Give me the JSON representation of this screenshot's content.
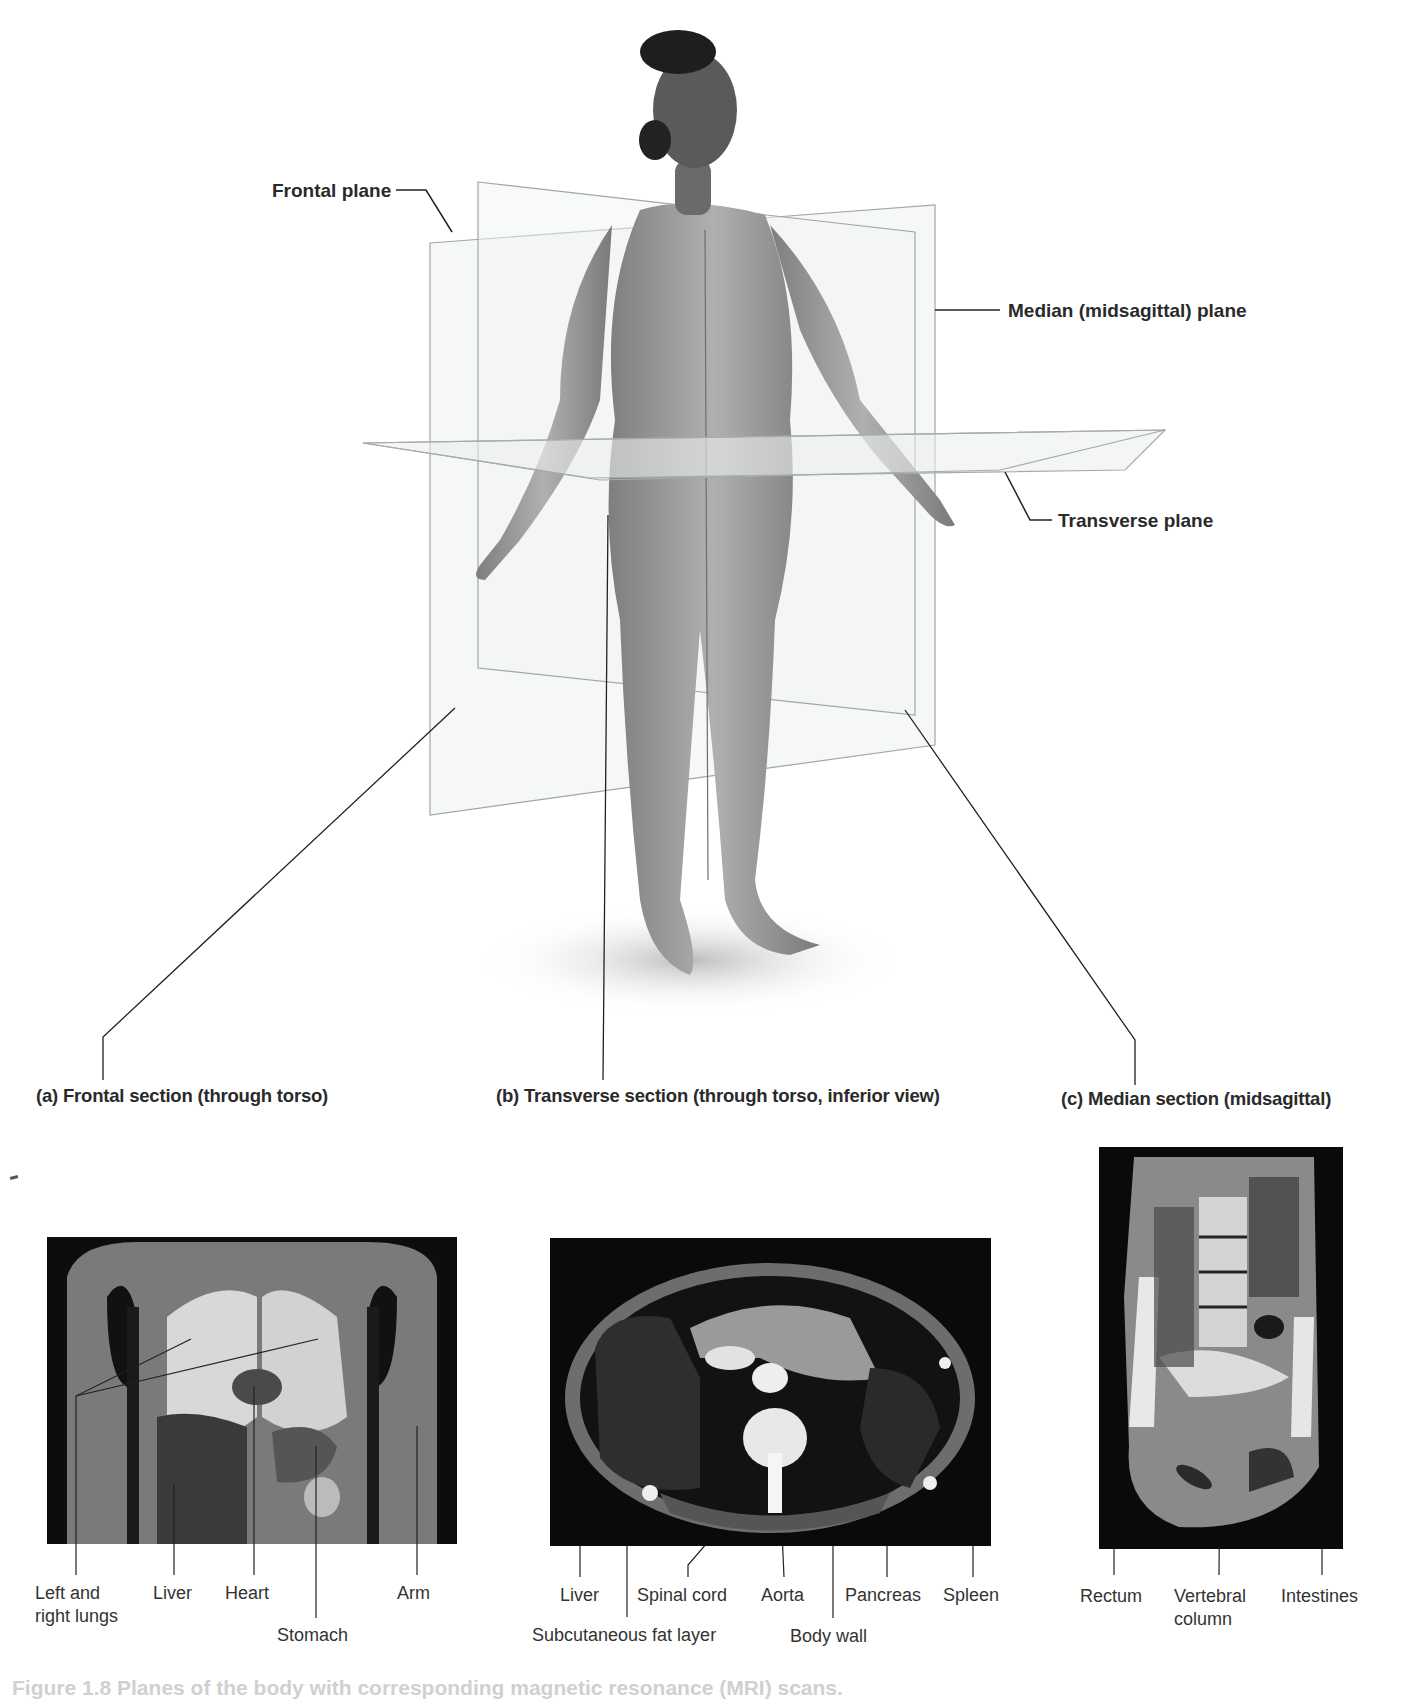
{
  "figure": {
    "top_view": {
      "description": "Standing woman in anatomical position with three intersecting translucent body planes",
      "plane_labels": {
        "frontal": "Frontal plane",
        "median": "Median (midsagittal) plane",
        "transverse": "Transverse plane"
      }
    },
    "sections": [
      {
        "id": "a",
        "title": "(a) Frontal section (through torso)",
        "scan_type": "MRI (coronal)",
        "labels": [
          "Left and right lungs",
          "Liver",
          "Heart",
          "Stomach",
          "Arm"
        ]
      },
      {
        "id": "b",
        "title": "(b) Transverse section (through torso, inferior view)",
        "scan_type": "CT (axial)",
        "labels": [
          "Liver",
          "Subcutaneous fat layer",
          "Spinal cord",
          "Aorta",
          "Body wall",
          "Pancreas",
          "Spleen"
        ]
      },
      {
        "id": "c",
        "title": "(c) Median section (midsagittal)",
        "scan_type": "MRI (sagittal)",
        "labels": [
          "Rectum",
          "Vertebral column",
          "Intestines"
        ]
      }
    ],
    "caption_partial": "Figure 1.8 Planes of the body with corresponding magnetic resonance (MRI) scans."
  },
  "labels": {
    "frontal_plane": "Frontal plane",
    "median_plane": "Median (midsagittal) plane",
    "transverse_plane": "Transverse plane",
    "section_a": "(a) Frontal section (through torso)",
    "section_b": "(b) Transverse section (through torso, inferior view)",
    "section_c": "(c) Median section (midsagittal)",
    "a_lungs_1": "Left and",
    "a_lungs_2": "right lungs",
    "a_liver": "Liver",
    "a_heart": "Heart",
    "a_stomach": "Stomach",
    "a_arm": "Arm",
    "b_liver": "Liver",
    "b_fat": "Subcutaneous fat layer",
    "b_spinal": "Spinal cord",
    "b_aorta": "Aorta",
    "b_bodywall": "Body wall",
    "b_pancreas": "Pancreas",
    "b_spleen": "Spleen",
    "c_rectum": "Rectum",
    "c_vert_1": "Vertebral",
    "c_vert_2": "column",
    "c_intestines": "Intestines",
    "caption": "Figure 1.8 Planes of the body with corresponding magnetic resonance (MRI) scans."
  },
  "colors": {
    "plane_fill": "#eef0f0",
    "plane_edge": "#9aa0a0",
    "body": "#9a9a9a",
    "scan_bg": "#0a0a0a",
    "text": "#2a2a2a"
  }
}
